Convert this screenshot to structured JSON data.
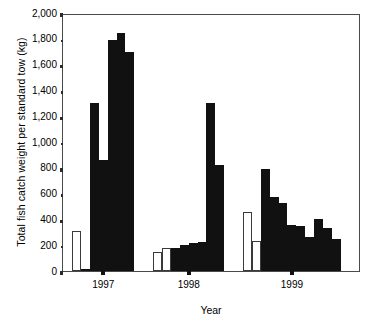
{
  "chart_data": {
    "type": "bar",
    "title": "",
    "xlabel": "Year",
    "ylabel": "Total fish catch weight per standard tow (kg)",
    "ylim": [
      0,
      2000
    ],
    "ytick_step": 200,
    "ytick_labels": [
      "0",
      "200",
      "400",
      "600",
      "800",
      "1,000",
      "1,200",
      "1,400",
      "1,600",
      "1,800",
      "2,000"
    ],
    "ytick_values": [
      0,
      200,
      400,
      600,
      800,
      1000,
      1200,
      1400,
      1600,
      1800,
      2000
    ],
    "xtick_labels": [
      "1997",
      "1998",
      "1999"
    ],
    "grid": false,
    "legend": "none",
    "series_note": "Open (white) bars and solid (black) bars plotted per tow within each year group",
    "groups": [
      {
        "label": "1997",
        "bars": [
          {
            "value": 310,
            "fill": "open"
          },
          {
            "value": 10,
            "fill": "filled"
          },
          {
            "value": 1300,
            "fill": "filled"
          },
          {
            "value": 860,
            "fill": "filled"
          },
          {
            "value": 1790,
            "fill": "filled"
          },
          {
            "value": 1845,
            "fill": "filled"
          },
          {
            "value": 1700,
            "fill": "filled"
          }
        ]
      },
      {
        "label": "1998",
        "bars": [
          {
            "value": 145,
            "fill": "open"
          },
          {
            "value": 175,
            "fill": "open"
          },
          {
            "value": 175,
            "fill": "filled"
          },
          {
            "value": 200,
            "fill": "filled"
          },
          {
            "value": 215,
            "fill": "filled"
          },
          {
            "value": 228,
            "fill": "filled"
          },
          {
            "value": 1300,
            "fill": "filled"
          },
          {
            "value": 820,
            "fill": "filled"
          }
        ]
      },
      {
        "label": "1999",
        "bars": [
          {
            "value": 460,
            "fill": "open"
          },
          {
            "value": 230,
            "fill": "open"
          },
          {
            "value": 790,
            "fill": "filled"
          },
          {
            "value": 570,
            "fill": "filled"
          },
          {
            "value": 525,
            "fill": "filled"
          },
          {
            "value": 360,
            "fill": "filled"
          },
          {
            "value": 350,
            "fill": "filled"
          },
          {
            "value": 260,
            "fill": "filled"
          },
          {
            "value": 400,
            "fill": "filled"
          },
          {
            "value": 330,
            "fill": "filled"
          },
          {
            "value": 245,
            "fill": "filled"
          }
        ]
      }
    ],
    "colors": {
      "filled": "#111111",
      "open": "#ffffff",
      "outline": "#3a3a3a",
      "axis": "#4a4a4a",
      "text": "#000000"
    }
  }
}
